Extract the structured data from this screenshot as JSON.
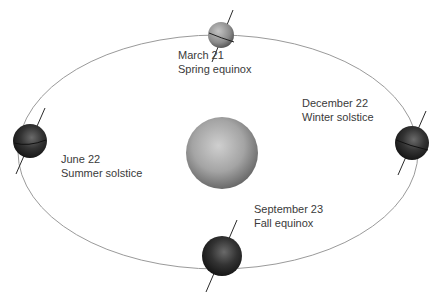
{
  "diagram": {
    "sun": {
      "name": "sun"
    },
    "positions": [
      {
        "id": "spring",
        "date": "March 21",
        "event": "Spring equinox"
      },
      {
        "id": "summer",
        "date": "June 22",
        "event": "Summer solstice"
      },
      {
        "id": "winter",
        "date": "December 22",
        "event": "Winter solstice"
      },
      {
        "id": "fall",
        "date": "September 23",
        "event": "Fall equinox"
      }
    ],
    "colors": {
      "orbit": "#9a9a9a",
      "sun_light": "#c8c8c8",
      "sun_dark": "#6e6e6e",
      "earth_dark": "#1e1e1e",
      "axis": "#2a2a2a",
      "text": "#3a3a3a"
    }
  }
}
